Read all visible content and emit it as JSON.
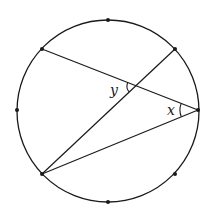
{
  "diagram": {
    "type": "circle-geometry",
    "circle": {
      "cx": 108,
      "cy": 111,
      "r": 91,
      "stroke": "#1a1a1a"
    },
    "points": [
      {
        "id": "top",
        "x": 108,
        "y": 20
      },
      {
        "id": "upper-right",
        "x": 175,
        "y": 49
      },
      {
        "id": "right",
        "x": 198,
        "y": 110
      },
      {
        "id": "lower-right",
        "x": 175,
        "y": 174
      },
      {
        "id": "bottom",
        "x": 108,
        "y": 202
      },
      {
        "id": "lower-left",
        "x": 42,
        "y": 174
      },
      {
        "id": "left",
        "x": 17,
        "y": 110
      },
      {
        "id": "upper-left",
        "x": 42,
        "y": 49
      }
    ],
    "segments": [
      {
        "from": "upper-left",
        "to": "right"
      },
      {
        "from": "lower-left",
        "to": "upper-right"
      },
      {
        "from": "lower-left",
        "to": "right"
      }
    ],
    "intersection": {
      "x": 136,
      "y": 86
    },
    "labels": {
      "y": "y",
      "x": "x"
    }
  }
}
